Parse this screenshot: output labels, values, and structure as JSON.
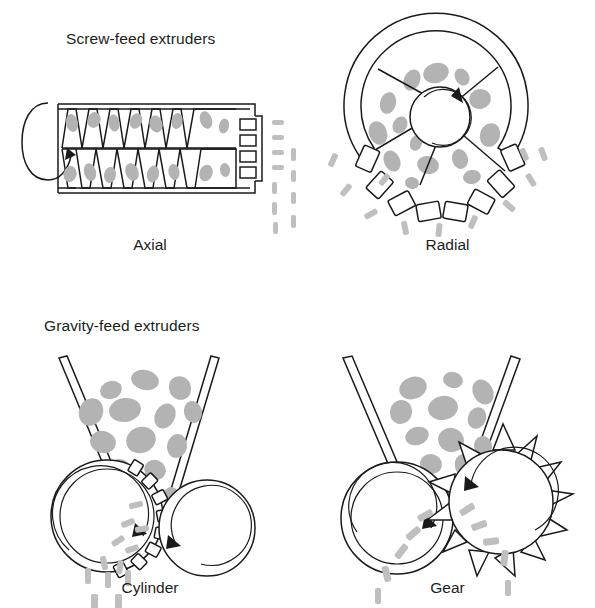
{
  "figure": {
    "type": "technical-diagram",
    "background_color": "#ffffff",
    "line_color": "#1a1a1a",
    "particle_color": "#b3b3b3",
    "strand_color": "#bfbfbf"
  },
  "headings": {
    "screw_feed": "Screw-feed extruders",
    "gravity_feed": "Gravity-feed extruders"
  },
  "captions": {
    "axial": "Axial",
    "radial": "Radial",
    "cylinder": "Cylinder",
    "gear": "Gear"
  },
  "panels": [
    {
      "id": "axial",
      "group": "Screw-feed extruders",
      "caption": "Axial",
      "position": "top-left",
      "components": [
        "rotation-arrow",
        "barrel",
        "screw-flights",
        "material-particles",
        "die-plate",
        "extrudate-strands"
      ],
      "die_openings": 4,
      "screw_flight_count": 6
    },
    {
      "id": "radial",
      "group": "Screw-feed extruders",
      "caption": "Radial",
      "position": "top-right",
      "components": [
        "outer-ring",
        "rotating-hub",
        "rotation-arrow",
        "spokes",
        "material-particles",
        "die-openings",
        "extrudate-strands"
      ],
      "spoke_count": 5,
      "die_openings": 8
    },
    {
      "id": "cylinder",
      "group": "Gravity-feed extruders",
      "caption": "Cylinder",
      "position": "bottom-left",
      "components": [
        "feed-chute-left",
        "feed-chute-right",
        "material-particles",
        "perforated-cylinder",
        "pressure-roller",
        "rotation-arrow-left",
        "rotation-arrow-right",
        "extrudate-strands"
      ],
      "die_openings": 10
    },
    {
      "id": "gear",
      "group": "Gravity-feed extruders",
      "caption": "Gear",
      "position": "bottom-right",
      "components": [
        "feed-chute-left",
        "feed-chute-right",
        "material-particles",
        "perforated-roller",
        "gear-roller",
        "rotation-arrow-left",
        "rotation-arrow-right",
        "extrudate-strands"
      ],
      "gear_teeth": 12
    }
  ]
}
